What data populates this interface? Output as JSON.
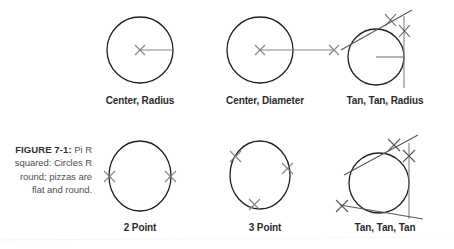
{
  "figure": {
    "caption_title": "FIGURE 7-1:",
    "caption_text": "Pi R squared: Circles R round; pizzas are flat and round.",
    "background_color": "#ffffff",
    "stroke_color": "#231f20",
    "marker_color": "#808285",
    "caption_color": "#4e4e52"
  },
  "diagrams": [
    {
      "id": "center-radius",
      "label": "Center, Radius",
      "row": 1,
      "column": 1,
      "markers": [
        "center"
      ],
      "construction_lines": [
        "radius"
      ]
    },
    {
      "id": "center-diameter",
      "label": "Center, Diameter",
      "row": 1,
      "column": 2,
      "markers": [
        "center",
        "diameter-endpoint"
      ],
      "construction_lines": [
        "diameter"
      ]
    },
    {
      "id": "tan-tan-radius",
      "label": "Tan, Tan, Radius",
      "row": 1,
      "column": 3,
      "markers": [
        "tangent-upper-left",
        "tangent-right"
      ],
      "construction_lines": [
        "tangent-diagonal",
        "tangent-vertical",
        "radius"
      ]
    },
    {
      "id": "2-point",
      "label": "2 Point",
      "row": 2,
      "column": 1,
      "markers": [
        "point-left",
        "point-right"
      ],
      "construction_lines": []
    },
    {
      "id": "3-point",
      "label": "3 Point",
      "row": 2,
      "column": 2,
      "markers": [
        "point-upper-left",
        "point-right",
        "point-bottom"
      ],
      "construction_lines": []
    },
    {
      "id": "tan-tan-tan",
      "label": "Tan, Tan, Tan",
      "row": 2,
      "column": 3,
      "markers": [
        "tangent-upper-left",
        "tangent-right",
        "tangent-lower-left"
      ],
      "construction_lines": [
        "tangent-diagonal-top",
        "tangent-vertical",
        "tangent-diagonal-bottom"
      ]
    }
  ]
}
